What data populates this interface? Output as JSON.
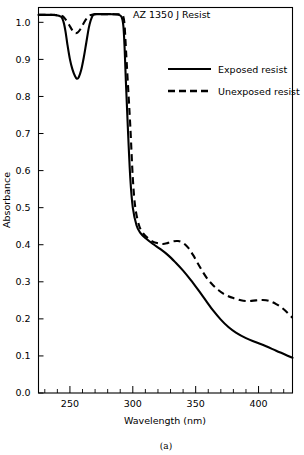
{
  "chart_data": {
    "type": "line",
    "title": "AZ 1350 J Resist",
    "xlabel": "Wavelength (nm)",
    "ylabel": "Absorbance",
    "panel_label": "(a)",
    "xlim": [
      225,
      427
    ],
    "ylim": [
      0.0,
      1.04
    ],
    "grid": false,
    "legend_position": "upper right",
    "x_major_ticks": [
      250,
      300,
      350,
      400
    ],
    "x_major_tick_labels": [
      "250",
      "300",
      "350",
      "400"
    ],
    "x_minor_tick_interval": 10,
    "y_major_ticks": [
      0.0,
      0.1,
      0.2,
      0.3,
      0.4,
      0.5,
      0.6,
      0.7,
      0.8,
      0.9,
      1.0
    ],
    "y_major_tick_labels": [
      "0.0",
      "0.1",
      "0.2",
      "0.3",
      "0.4",
      "0.5",
      "0.6",
      "0.7",
      "0.8",
      "0.9",
      "1.0"
    ],
    "series": [
      {
        "name": "Exposed resist",
        "style": "solid",
        "color": "#000000",
        "x": [
          225,
          232,
          238,
          243,
          245,
          246.5,
          248,
          250,
          252,
          254,
          255.5,
          257,
          259,
          261,
          263,
          265,
          266.5,
          268,
          269,
          270,
          272,
          276,
          282,
          288,
          291,
          292.5,
          293.5,
          294.5,
          296,
          298,
          300,
          303,
          306,
          310,
          316,
          322,
          328,
          334,
          340,
          346,
          352,
          358,
          364,
          370,
          376,
          382,
          390,
          398,
          406,
          414,
          421,
          427
        ],
        "y": [
          1.02,
          1.02,
          1.02,
          1.015,
          1.0,
          0.975,
          0.94,
          0.9,
          0.873,
          0.855,
          0.848,
          0.852,
          0.872,
          0.905,
          0.945,
          0.985,
          1.005,
          1.018,
          1.021,
          1.022,
          1.022,
          1.022,
          1.022,
          1.021,
          1.015,
          0.99,
          0.93,
          0.84,
          0.72,
          0.58,
          0.5,
          0.452,
          0.432,
          0.418,
          0.402,
          0.388,
          0.372,
          0.352,
          0.33,
          0.305,
          0.278,
          0.25,
          0.222,
          0.198,
          0.178,
          0.163,
          0.148,
          0.137,
          0.126,
          0.114,
          0.104,
          0.095
        ]
      },
      {
        "name": "Unexposed resist",
        "style": "dashed",
        "color": "#000000",
        "x": [
          225,
          235,
          243,
          246,
          249,
          252,
          254,
          256,
          258,
          260,
          262,
          264,
          266,
          268,
          270,
          276,
          284,
          290,
          292.5,
          293.5,
          294.5,
          296,
          298,
          300,
          302,
          305,
          308,
          312,
          316,
          320,
          324,
          328,
          332,
          336,
          340,
          344,
          348,
          352,
          356,
          360,
          364,
          368,
          372,
          376,
          380,
          386,
          392,
          398,
          403,
          408,
          414,
          420,
          427
        ],
        "y": [
          1.02,
          1.02,
          1.018,
          1.01,
          0.995,
          0.978,
          0.971,
          0.972,
          0.98,
          0.992,
          1.004,
          1.013,
          1.019,
          1.021,
          1.022,
          1.022,
          1.022,
          1.021,
          1.015,
          0.99,
          0.93,
          0.84,
          0.72,
          0.58,
          0.5,
          0.452,
          0.432,
          0.418,
          0.408,
          0.404,
          0.402,
          0.405,
          0.409,
          0.41,
          0.405,
          0.392,
          0.372,
          0.348,
          0.325,
          0.305,
          0.29,
          0.278,
          0.268,
          0.261,
          0.256,
          0.25,
          0.248,
          0.25,
          0.251,
          0.249,
          0.24,
          0.226,
          0.203
        ]
      }
    ]
  },
  "legend": {
    "entries": [
      {
        "label": "Exposed resist",
        "style": "solid"
      },
      {
        "label": "Unexposed resist",
        "style": "dashed"
      }
    ]
  }
}
